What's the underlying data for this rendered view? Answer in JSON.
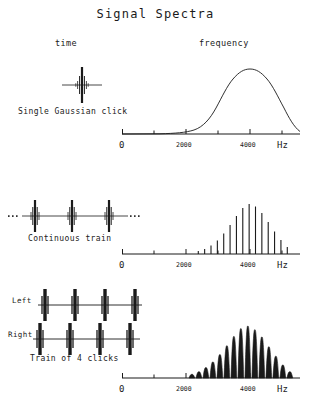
{
  "figure": {
    "title": "Signal Spectra",
    "columns": {
      "time": "time",
      "frequency": "frequency"
    },
    "row_labels": {
      "row1": "Single Gaussian click",
      "row2": "Continuous train",
      "row3": "Train of 4 clicks"
    },
    "channel_labels": {
      "left": "Left",
      "right": "Right"
    },
    "axis": {
      "tick_labels": [
        "0",
        "2000",
        "4000"
      ],
      "tick_values": [
        0,
        2000,
        4000
      ],
      "unit_label": "Hz",
      "minor_tick_values": [
        0,
        1000,
        2000,
        3000,
        4000,
        5000
      ],
      "xlim": [
        0,
        5600
      ]
    },
    "colors": {
      "ink": "#1a1a1a",
      "background": "#ffffff"
    }
  },
  "chart_data": [
    {
      "id": "gaussian-click-spectrum",
      "type": "line",
      "title": "Single Gaussian click",
      "xlabel": "Hz",
      "ylabel": "",
      "xlim": [
        0,
        5600
      ],
      "ylim": [
        0,
        1
      ],
      "grid": false,
      "legend": false,
      "annotation": "Smooth Gaussian envelope centered at 4000 Hz",
      "center_hz": 4000,
      "sigma_hz": 900,
      "x": [
        0,
        500,
        1000,
        1500,
        2000,
        2200,
        2400,
        2600,
        2800,
        3000,
        3200,
        3400,
        3600,
        3800,
        4000,
        4200,
        4400,
        4600,
        4800,
        5000,
        5200,
        5400,
        5600
      ],
      "y": [
        0.0,
        0.0,
        0.0,
        0.01,
        0.03,
        0.05,
        0.09,
        0.15,
        0.23,
        0.33,
        0.46,
        0.6,
        0.75,
        0.9,
        1.0,
        0.97,
        0.88,
        0.73,
        0.57,
        0.4,
        0.25,
        0.14,
        0.07
      ]
    },
    {
      "id": "continuous-train-spectrum",
      "type": "bar",
      "title": "Continuous train",
      "xlabel": "Hz",
      "ylabel": "",
      "xlim": [
        0,
        5600
      ],
      "ylim": [
        0,
        1
      ],
      "grid": false,
      "legend": false,
      "annotation": "Harmonic line spectrum under a Gaussian envelope peaking near 4000 Hz",
      "line_spacing_hz": 200,
      "categories": [
        2400,
        2600,
        2800,
        3000,
        3200,
        3400,
        3600,
        3800,
        4000,
        4200,
        4400,
        4600,
        4800,
        5000,
        5200
      ],
      "values": [
        0.06,
        0.1,
        0.17,
        0.27,
        0.41,
        0.58,
        0.76,
        0.92,
        1.0,
        0.95,
        0.82,
        0.64,
        0.45,
        0.28,
        0.14
      ]
    },
    {
      "id": "train-of-4-clicks-spectrum",
      "type": "line",
      "title": "Train of 4 clicks",
      "xlabel": "Hz",
      "ylabel": "",
      "xlim": [
        0,
        5600
      ],
      "ylim": [
        0,
        1
      ],
      "grid": false,
      "legend": false,
      "annotation": "Gaussian envelope modulated by interference fringes; rounded lobes separated by deep narrow valleys",
      "lobe_spacing_hz": 220,
      "categories": [
        2200,
        2420,
        2640,
        2860,
        3080,
        3300,
        3520,
        3740,
        3960,
        4180,
        4400,
        4620,
        4840,
        5060,
        5280
      ],
      "values": [
        0.07,
        0.12,
        0.2,
        0.31,
        0.45,
        0.62,
        0.8,
        0.95,
        1.0,
        0.93,
        0.79,
        0.6,
        0.42,
        0.25,
        0.12
      ]
    }
  ],
  "waveforms": [
    {
      "id": "single-gaussian-click-waveform",
      "type": "impulse-train",
      "pulse_count": 1,
      "continuation_marks": false
    },
    {
      "id": "continuous-train-waveform",
      "type": "impulse-train",
      "pulse_count": 3,
      "continuation_marks": true
    },
    {
      "id": "train-of-4-clicks-left-waveform",
      "type": "impulse-train",
      "pulse_count": 4,
      "continuation_marks": false
    },
    {
      "id": "train-of-4-clicks-right-waveform",
      "type": "impulse-train",
      "pulse_count": 4,
      "continuation_marks": false
    }
  ]
}
